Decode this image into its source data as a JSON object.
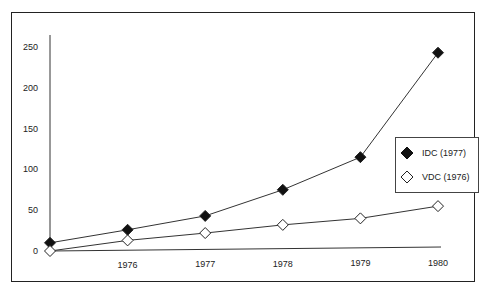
{
  "chart_data": {
    "type": "line",
    "title": "",
    "xlabel": "",
    "ylabel": "",
    "x": [
      "1975",
      "1976",
      "1977",
      "1978",
      "1979",
      "1980"
    ],
    "x_tick_labels": [
      "1976",
      "1977",
      "1978",
      "1979",
      "1980"
    ],
    "y_tick_labels": [
      "0",
      "50",
      "100",
      "150",
      "200",
      "250"
    ],
    "ylim": [
      0,
      250
    ],
    "grid": false,
    "legend_position": "right",
    "series": [
      {
        "name": "IDC (1977)",
        "marker": "filled-diamond",
        "values": [
          10,
          26,
          43,
          75,
          115,
          243
        ]
      },
      {
        "name": "VDC (1976)",
        "marker": "open-diamond",
        "values": [
          0,
          13,
          22,
          32,
          40,
          55
        ]
      }
    ]
  },
  "legend": {
    "items": [
      {
        "label": "IDC (1977)"
      },
      {
        "label": "VDC (1976)"
      }
    ]
  }
}
